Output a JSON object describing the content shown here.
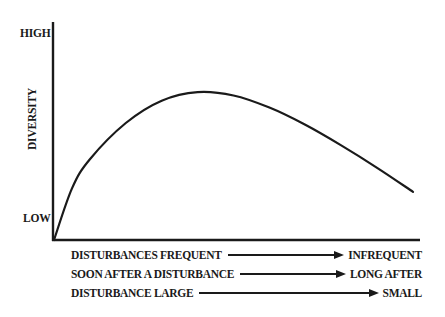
{
  "chart_data": {
    "type": "line",
    "title": "",
    "ylabel": "DIVERSITY",
    "xlabel": "",
    "y_tick_labels": [
      "LOW",
      "HIGH"
    ],
    "x_axis_annotations": [
      {
        "left": "DISTURBANCES FREQUENT",
        "right": "INFREQUENT"
      },
      {
        "left": "SOON AFTER A DISTURBANCE",
        "right": "LONG AFTER"
      },
      {
        "left": "DISTURBANCE LARGE",
        "right": "SMALL"
      }
    ],
    "grid": false,
    "legend": null,
    "series": [
      {
        "name": "Diversity",
        "x": [
          0,
          0.05,
          0.1,
          0.2,
          0.3,
          0.4,
          0.5,
          0.6,
          0.7,
          0.8,
          0.9,
          1.0
        ],
        "y": [
          0,
          0.3,
          0.47,
          0.68,
          0.81,
          0.86,
          0.84,
          0.77,
          0.67,
          0.55,
          0.42,
          0.28
        ]
      }
    ],
    "xlim": [
      0,
      1
    ],
    "ylim": [
      0,
      1
    ],
    "colors": {
      "line": "#1a1a1a",
      "axis": "#1a1a1a",
      "background": "#ffffff"
    }
  },
  "axes": {
    "y_high_label": "HIGH",
    "y_low_label": "LOW",
    "y_title": "DIVERSITY"
  },
  "annotations": [
    {
      "left": "DISTURBANCES FREQUENT",
      "right": "INFREQUENT"
    },
    {
      "left": "SOON AFTER A DISTURBANCE",
      "right": "LONG AFTER"
    },
    {
      "left": "DISTURBANCE LARGE",
      "right": "SMALL"
    }
  ]
}
